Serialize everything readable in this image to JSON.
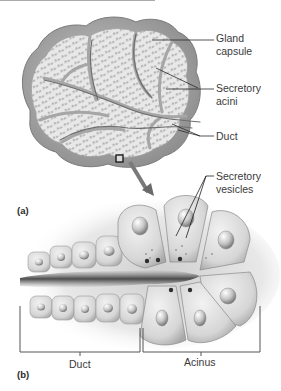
{
  "figure": {
    "panels": [
      {
        "id": "a",
        "label": "(a)",
        "description": "Lobed exocrine gland with capsule, secretory acini and ducts"
      },
      {
        "id": "b",
        "label": "(b)",
        "description": "Magnified acinus and duct showing secretory cells and vesicles"
      }
    ],
    "labels": {
      "gland_capsule": "Gland\ncapsule",
      "secretory_acini": "Secretory\nacini",
      "duct_a": "Duct",
      "secretory_vesicles": "Secretory\nvesicles",
      "duct_b": "Duct",
      "acinus": "Acinus"
    },
    "colors": {
      "background": "#ffffff",
      "capsule": "#9a9a9a",
      "lobule_fill": "#e6e6e6",
      "septum": "#b0b0b0",
      "acini_dots": "#5a5a5a",
      "cell_fill": "#dcdcdc",
      "lumen": "#4a4a4a",
      "leader_line": "#2a2a2a",
      "text": "#3a3a3a"
    }
  }
}
